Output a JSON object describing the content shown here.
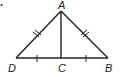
{
  "diagram": {
    "type": "geometry-triangle",
    "stroke_color": "#222222",
    "points": [
      {
        "name": "A",
        "label": "A"
      },
      {
        "name": "B",
        "label": "B"
      },
      {
        "name": "C",
        "label": "C"
      },
      {
        "name": "D",
        "label": "D"
      }
    ],
    "segments": [
      "AD",
      "AB",
      "AC",
      "DC",
      "CB"
    ],
    "congruence_marks": {
      "double_tick": [
        "AD",
        "AB"
      ],
      "single_tick": [
        "DC",
        "CB"
      ]
    }
  }
}
